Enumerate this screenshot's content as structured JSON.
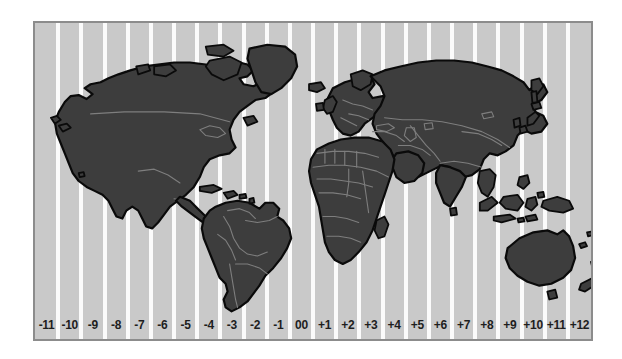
{
  "figure": {
    "kind": "world-time-zone-map",
    "projection_note": "equirectangular world map divided into vertical time zone bands"
  },
  "colors": {
    "page_background": "#ffffff",
    "ocean_band": "#c9c9c9",
    "band_divider": "#fbfbfb",
    "land_fill": "#3d3d3d",
    "coastline": "#0a0a0a",
    "country_border": "#7e7e7e",
    "frame_border": "#8c8c8c",
    "label_text": "#1e1e1e"
  },
  "map_frame": {
    "x": 33,
    "y": 21,
    "width": 560,
    "height": 320
  },
  "timezones": {
    "count": 24,
    "label_row_name": "utc-offset-labels",
    "items": [
      {
        "label": "-11",
        "offset": -11
      },
      {
        "label": "-10",
        "offset": -10
      },
      {
        "label": "-9",
        "offset": -9
      },
      {
        "label": "-8",
        "offset": -8
      },
      {
        "label": "-7",
        "offset": -7
      },
      {
        "label": "-6",
        "offset": -6
      },
      {
        "label": "-5",
        "offset": -5
      },
      {
        "label": "-4",
        "offset": -4
      },
      {
        "label": "-3",
        "offset": -3
      },
      {
        "label": "-2",
        "offset": -2
      },
      {
        "label": "-1",
        "offset": -1
      },
      {
        "label": "00",
        "offset": 0
      },
      {
        "label": "+1",
        "offset": 1
      },
      {
        "label": "+2",
        "offset": 2
      },
      {
        "label": "+3",
        "offset": 3
      },
      {
        "label": "+4",
        "offset": 4
      },
      {
        "label": "+5",
        "offset": 5
      },
      {
        "label": "+6",
        "offset": 6
      },
      {
        "label": "+7",
        "offset": 7
      },
      {
        "label": "+8",
        "offset": 8
      },
      {
        "label": "+9",
        "offset": 9
      },
      {
        "label": "+10",
        "offset": 10
      },
      {
        "label": "+11",
        "offset": 11
      },
      {
        "label": "+12",
        "offset": 12
      }
    ]
  },
  "landmasses": [
    {
      "name": "north-america"
    },
    {
      "name": "greenland"
    },
    {
      "name": "south-america"
    },
    {
      "name": "eurasia"
    },
    {
      "name": "africa"
    },
    {
      "name": "australia"
    },
    {
      "name": "indonesia"
    },
    {
      "name": "japan"
    },
    {
      "name": "new-zealand"
    },
    {
      "name": "iceland"
    },
    {
      "name": "british-isles"
    },
    {
      "name": "madagascar"
    },
    {
      "name": "caribbean"
    }
  ]
}
